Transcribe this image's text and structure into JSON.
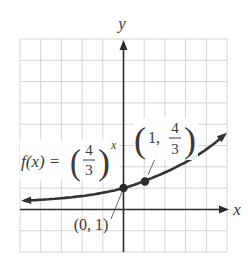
{
  "chart_data": {
    "type": "line",
    "title": "",
    "function_label": {
      "prefix": "f(x) = ",
      "base_numerator": "4",
      "base_denominator": "3",
      "exponent": "x"
    },
    "xlabel": "x",
    "ylabel": "y",
    "xlim": [
      -5,
      5
    ],
    "ylim": [
      -2,
      8
    ],
    "grid": true,
    "grid_step": 1,
    "series": [
      {
        "name": "f(x) = (4/3)^x",
        "x": [
          -4.8,
          -4,
          -3,
          -2,
          -1,
          0,
          1,
          2,
          3,
          4,
          4.9
        ],
        "y": [
          0.25,
          0.32,
          0.42,
          0.56,
          0.75,
          1,
          1.333,
          1.778,
          2.37,
          3.16,
          4.09
        ]
      }
    ],
    "annotations": [
      {
        "point": [
          0,
          1
        ],
        "label": "(0, 1)"
      },
      {
        "point": [
          1,
          1.333
        ],
        "label_prefix": "(1, ",
        "label_numerator": "4",
        "label_denominator": "3",
        "label_suffix": ")"
      }
    ]
  },
  "colors": {
    "grid": "#d4d4d4",
    "axis": "#2b2b2b",
    "curve": "#333333",
    "text": "#3a3a3a"
  }
}
